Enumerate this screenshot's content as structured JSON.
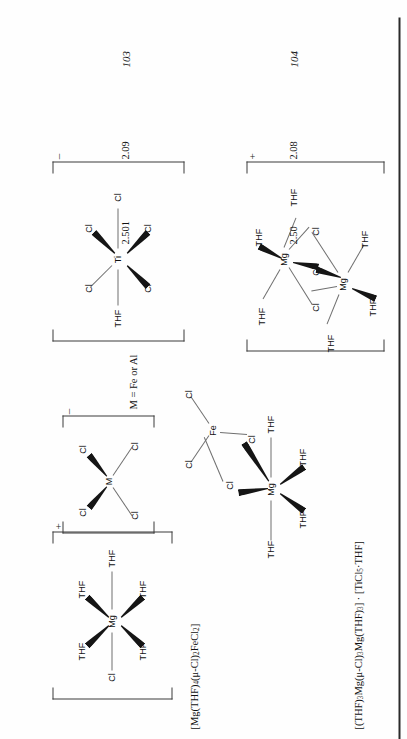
{
  "page": {
    "orientation": "rotated-90-ccw",
    "background": "#fefefe",
    "ink": "#111111"
  },
  "compound_numbers": [
    {
      "id": "compound-103",
      "label": "103"
    },
    {
      "id": "compound-104",
      "label": "104"
    }
  ],
  "distances": {
    "row_103": [
      "2.501",
      "2.09"
    ],
    "row_104": [
      "2.50",
      "2.08"
    ]
  },
  "captions": {
    "caption_103_parts": [
      "[Mg(THF)",
      "4",
      "(μ-Cl)",
      "2",
      "FeCl",
      "2",
      "]"
    ],
    "caption_103_plain": "[Mg(THF)4(μ-Cl)2FeCl2]",
    "caption_104_plain": "[(THF)3Mg(μ-Cl)3Mg(THF)3] · [TiCl5·THF]",
    "note_M": "M = Fe or Al"
  },
  "structures": {
    "mcl4": {
      "name": "tetrachlorometalate-anion",
      "center": "M",
      "ligands": [
        "Cl",
        "Cl",
        "Cl",
        "Cl"
      ],
      "charge": "–"
    },
    "mg_thf5_cl": {
      "name": "magnesium-pentakis-thf-chloride-cation",
      "center": "Mg",
      "ligands": [
        "THF",
        "THF",
        "THF",
        "THF",
        "THF",
        "Cl"
      ],
      "charge": "+"
    },
    "mg_fe_dimer": {
      "name": "magnesium-iron-dichloro-bridged",
      "centers": [
        "Mg",
        "Fe"
      ],
      "bridges": [
        "Cl",
        "Cl"
      ],
      "mg_ligands": [
        "THF",
        "THF",
        "THF",
        "THF"
      ],
      "fe_ligands": [
        "Cl",
        "Cl"
      ],
      "charge": ""
    },
    "mg2_cl3_dimer": {
      "name": "bis-magnesium-trichloro-bridged-cation",
      "centers": [
        "Mg",
        "Mg"
      ],
      "bridges": [
        "Cl",
        "Cl",
        "Cl"
      ],
      "mg_top_ligands": [
        "THF",
        "THF",
        "THF"
      ],
      "mg_bottom_ligands": [
        "THF",
        "THF",
        "THF"
      ],
      "charge": "+"
    },
    "ticl5_thf": {
      "name": "pentachloro-thf-titanate-anion",
      "center": "Ti",
      "ligands": [
        "Cl",
        "Cl",
        "Cl",
        "Cl",
        "Cl",
        "THF"
      ],
      "charge": "–"
    }
  },
  "labels": {
    "Mg": "Mg",
    "Fe": "Fe",
    "Ti": "Ti",
    "M": "M",
    "Cl": "Cl",
    "THF": "THF",
    "plus": "+",
    "minus": "–"
  }
}
